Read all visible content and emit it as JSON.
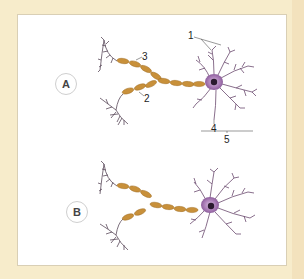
{
  "diagram": {
    "title": "",
    "panels": [
      {
        "id": "A",
        "badge": "A",
        "labels": {
          "l1": "1",
          "l2": "2",
          "l3": "3",
          "l4": "4",
          "l5": "5"
        }
      },
      {
        "id": "B",
        "badge": "B"
      }
    ],
    "colors": {
      "background": "#f7eccb",
      "panel": "#ffffff",
      "myelin": "#c8903a",
      "cell_body": "#b58ac0",
      "nucleus": "#2a1a2e",
      "dendrites": "#6b4a6e"
    }
  }
}
